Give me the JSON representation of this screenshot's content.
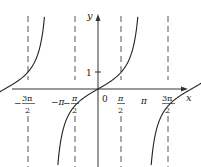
{
  "chart_data": {
    "type": "line",
    "title": "",
    "function": "y = tan x",
    "xlabel": "x",
    "ylabel": "y",
    "x_ticks": [
      {
        "value": -4.712,
        "label_num": "3π",
        "label_den": "2",
        "sign": "−"
      },
      {
        "value": -3.1416,
        "label": "−π"
      },
      {
        "value": -1.5708,
        "label_num": "π",
        "label_den": "2",
        "sign": "−"
      },
      {
        "value": 0,
        "label": "0"
      },
      {
        "value": 1.5708,
        "label_num": "π",
        "label_den": "2",
        "sign": ""
      },
      {
        "value": 3.1416,
        "label": "π"
      },
      {
        "value": 4.712,
        "label_num": "3π",
        "label_den": "2",
        "sign": ""
      }
    ],
    "y_ticks": [
      {
        "value": 1,
        "label": "1"
      }
    ],
    "asymptotes": [
      -4.712,
      -1.5708,
      1.5708,
      4.712
    ],
    "xlim": [
      -6.5,
      5.8
    ],
    "ylim": [
      -4.5,
      5.2
    ],
    "grid": false,
    "legend": null
  },
  "labels": {
    "x_axis": "x",
    "y_axis": "y",
    "origin": "0",
    "one": "1",
    "neg": "−",
    "pi": "π",
    "neg_pi": "−π",
    "three_pi": "3π",
    "two": "2"
  }
}
